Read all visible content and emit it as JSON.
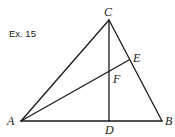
{
  "figure": {
    "example_label": "Ex. 15",
    "colors": {
      "line": "#1a1a1a",
      "background": "#ffffff"
    },
    "points": {
      "A": {
        "label": "A",
        "x": 21,
        "y": 121
      },
      "B": {
        "label": "B",
        "x": 162,
        "y": 121
      },
      "C": {
        "label": "C",
        "x": 109,
        "y": 20
      },
      "D": {
        "label": "D",
        "x": 109,
        "y": 121
      },
      "E": {
        "label": "E",
        "x": 129,
        "y": 60
      },
      "F": {
        "label": "F",
        "x": 109,
        "y": 71
      }
    },
    "segments": [
      {
        "from": "A",
        "to": "B"
      },
      {
        "from": "A",
        "to": "C"
      },
      {
        "from": "C",
        "to": "B"
      },
      {
        "from": "C",
        "to": "D"
      },
      {
        "from": "A",
        "to": "E"
      }
    ]
  }
}
